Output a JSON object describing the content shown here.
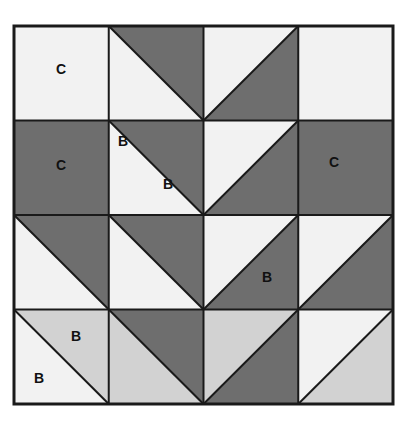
{
  "diagram": {
    "kind": "quilt-block-diagram",
    "title": "",
    "grid": {
      "rows": 4,
      "cols": 4
    },
    "geometry": {
      "block_x": 14,
      "block_y": 26,
      "block_width": 379,
      "block_height": 378,
      "cell_width": 94.75,
      "cell_height": 94.5
    },
    "colors": {
      "background": "#ffffff",
      "dark": "#6e6e6e",
      "medium": "#d2d2d2",
      "light": "#f2f2f2",
      "line": "#1a1a1a",
      "label_text": "#111111"
    },
    "stroke": {
      "outer_border_width": 3,
      "grid_line_width": 2,
      "diagonal_line_width": 2
    },
    "patch_codes": [
      "B",
      "C"
    ],
    "cells": [
      {
        "row": 1,
        "col": 1,
        "type": "solid",
        "fill": "light"
      },
      {
        "row": 1,
        "col": 2,
        "type": "hst-tl",
        "fill_a": "light",
        "fill_b": "dark"
      },
      {
        "row": 1,
        "col": 3,
        "type": "hst-tr",
        "fill_a": "light",
        "fill_b": "dark"
      },
      {
        "row": 1,
        "col": 4,
        "type": "solid",
        "fill": "light"
      },
      {
        "row": 2,
        "col": 1,
        "type": "solid",
        "fill": "dark"
      },
      {
        "row": 2,
        "col": 2,
        "type": "hst-br",
        "fill_a": "dark",
        "fill_b": "light"
      },
      {
        "row": 2,
        "col": 3,
        "type": "hst-bl",
        "fill_a": "dark",
        "fill_b": "light"
      },
      {
        "row": 2,
        "col": 4,
        "type": "solid",
        "fill": "dark"
      },
      {
        "row": 3,
        "col": 1,
        "type": "hst-tl",
        "fill_a": "light",
        "fill_b": "dark"
      },
      {
        "row": 3,
        "col": 2,
        "type": "hst-tl",
        "fill_a": "light",
        "fill_b": "dark"
      },
      {
        "row": 3,
        "col": 3,
        "type": "hst-tr",
        "fill_a": "light",
        "fill_b": "dark"
      },
      {
        "row": 3,
        "col": 4,
        "type": "hst-tr",
        "fill_a": "light",
        "fill_b": "dark"
      },
      {
        "row": 4,
        "col": 1,
        "type": "hst-tl",
        "fill_a": "light",
        "fill_b": "medium"
      },
      {
        "row": 4,
        "col": 2,
        "type": "hst-tl",
        "fill_a": "medium",
        "fill_b": "dark"
      },
      {
        "row": 4,
        "col": 3,
        "type": "hst-tr",
        "fill_a": "medium",
        "fill_b": "dark"
      },
      {
        "row": 4,
        "col": 4,
        "type": "hst-tr",
        "fill_a": "light",
        "fill_b": "medium"
      }
    ],
    "labels": [
      {
        "id": "label-c-top-left",
        "text": "C",
        "x": 61,
        "y": 70
      },
      {
        "id": "label-c-mid-left",
        "text": "C",
        "x": 61,
        "y": 166
      },
      {
        "id": "label-b-upper-center",
        "text": "B",
        "x": 123,
        "y": 142
      },
      {
        "id": "label-b-diamond",
        "text": "B",
        "x": 168,
        "y": 185
      },
      {
        "id": "label-c-mid-right",
        "text": "C",
        "x": 334,
        "y": 163
      },
      {
        "id": "label-b-right",
        "text": "B",
        "x": 267,
        "y": 278
      },
      {
        "id": "label-b-bottom-upper",
        "text": "B",
        "x": 76,
        "y": 337
      },
      {
        "id": "label-b-bottom-lower",
        "text": "B",
        "x": 39,
        "y": 379
      }
    ]
  }
}
